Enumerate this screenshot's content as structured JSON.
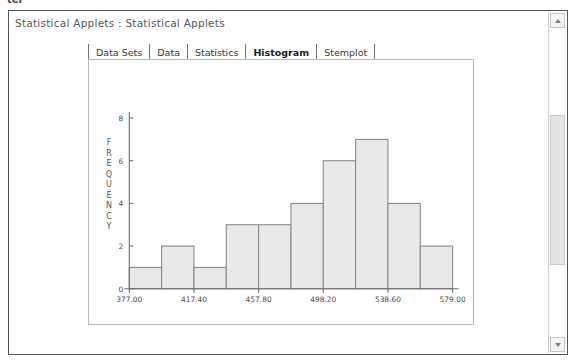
{
  "window": {
    "title": "Statistical Applets : Statistical Applets",
    "top_artifact": "ter"
  },
  "tabs": [
    {
      "label": "Data Sets",
      "selected": false
    },
    {
      "label": "Data",
      "selected": false
    },
    {
      "label": "Statistics",
      "selected": false
    },
    {
      "label": "Histogram",
      "selected": true
    },
    {
      "label": "Stemplot",
      "selected": false
    }
  ],
  "scrollbar": {
    "up_icon": "chevron-up-icon",
    "down_icon": "chevron-down-icon",
    "thumb_position_percent": 55
  },
  "colors": {
    "bar_fill": "#e9e9e9",
    "bar_stroke": "#8a8a8a",
    "axis": "#6e6e6e",
    "text": "#4f4f4f",
    "panel_border": "#b9b9b9"
  },
  "chart_data": {
    "type": "bar",
    "title": "",
    "xlabel": "",
    "ylabel": "FREQUENCY",
    "ylabel_letters": [
      "F",
      "R",
      "E",
      "Q",
      "U",
      "E",
      "N",
      "C",
      "Y"
    ],
    "grid": false,
    "legend": false,
    "ylim": [
      0,
      8
    ],
    "ytick_values": [
      0,
      2,
      4,
      6,
      8
    ],
    "ytick_labels": [
      "0",
      "2",
      "4",
      "6",
      "8"
    ],
    "xlim": [
      377.0,
      579.0
    ],
    "xtick_values": [
      377.0,
      417.4,
      457.8,
      498.2,
      538.6,
      579.0
    ],
    "xtick_labels": [
      "377.00",
      "417.40",
      "457.80",
      "498.20",
      "538.60",
      "579.00"
    ],
    "bin_width": 20.2,
    "bin_edges": [
      377.0,
      397.2,
      417.4,
      437.6,
      457.8,
      478.0,
      498.2,
      518.4,
      538.6,
      558.8,
      579.0
    ],
    "categories": [
      "377.00-397.20",
      "397.20-417.40",
      "417.40-437.60",
      "437.60-457.80",
      "457.80-478.00",
      "478.00-498.20",
      "498.20-518.40",
      "518.40-538.60",
      "538.60-558.80",
      "558.80-579.00"
    ],
    "values": [
      1,
      2,
      1,
      3,
      3,
      4,
      6,
      7,
      4,
      2
    ]
  }
}
